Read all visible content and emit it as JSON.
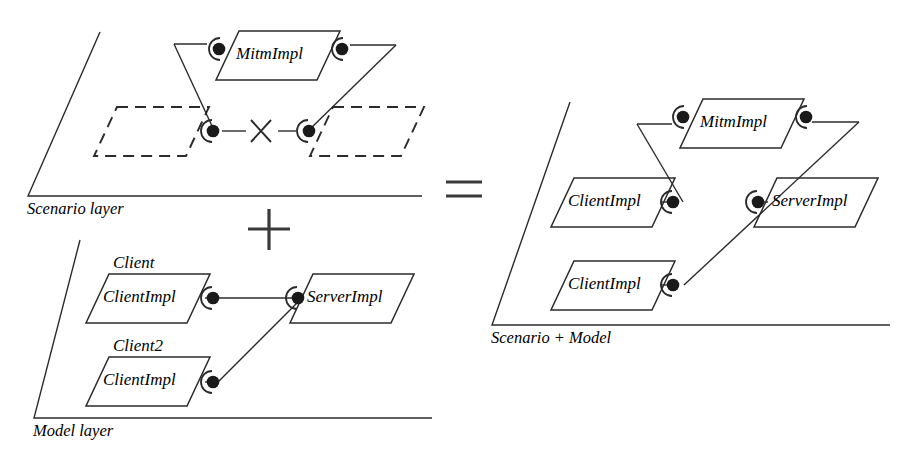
{
  "figure": {
    "background_color": "#ffffff",
    "line_color": "#2b2b2b"
  },
  "operators": {
    "plus": "+",
    "times": "×",
    "equals": "="
  },
  "panels": {
    "scenario": {
      "layer_label": "Scenario layer",
      "components": [
        {
          "id": "mitm",
          "label": "MitmImpl",
          "style": "solid"
        },
        {
          "id": "scenario-left-placeholder",
          "label": "",
          "style": "dashed"
        },
        {
          "id": "scenario-right-placeholder",
          "label": "",
          "style": "dashed"
        }
      ],
      "connector_symbol": "×"
    },
    "model": {
      "layer_label": "Model layer",
      "components": [
        {
          "id": "client1",
          "role": "Client",
          "label": "ClientImpl",
          "style": "solid"
        },
        {
          "id": "client2",
          "role": "Client2",
          "label": "ClientImpl",
          "style": "solid"
        },
        {
          "id": "server",
          "role": "",
          "label": "ServerImpl",
          "style": "solid"
        }
      ]
    },
    "result": {
      "layer_label": "Scenario + Model",
      "components": [
        {
          "id": "r-mitm",
          "label": "MitmImpl",
          "style": "solid"
        },
        {
          "id": "r-client1",
          "label": "ClientImpl",
          "style": "solid"
        },
        {
          "id": "r-client2",
          "label": "ClientImpl",
          "style": "solid"
        },
        {
          "id": "r-server",
          "label": "ServerImpl",
          "style": "solid"
        }
      ]
    }
  },
  "icons": {
    "ball_socket": "ball-and-socket-connector",
    "plane": "layer-plane-axes"
  }
}
